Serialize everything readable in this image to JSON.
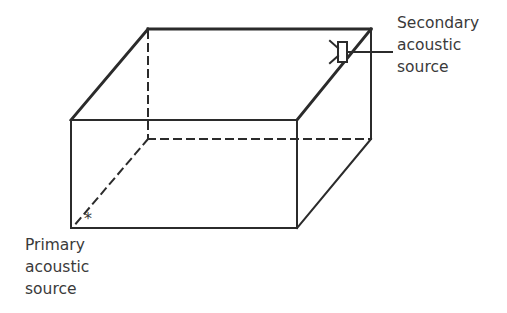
{
  "diagram": {
    "colors": {
      "line": "#2b2b2b",
      "text": "#3a3a3a",
      "background": "#ffffff"
    },
    "secondary_source": {
      "label_lines": [
        "Secondary",
        "acoustic",
        "source"
      ],
      "icon": "loudspeaker-icon"
    },
    "primary_source": {
      "label_lines": [
        "Primary",
        "acoustic",
        "source"
      ],
      "marker": "*"
    }
  }
}
